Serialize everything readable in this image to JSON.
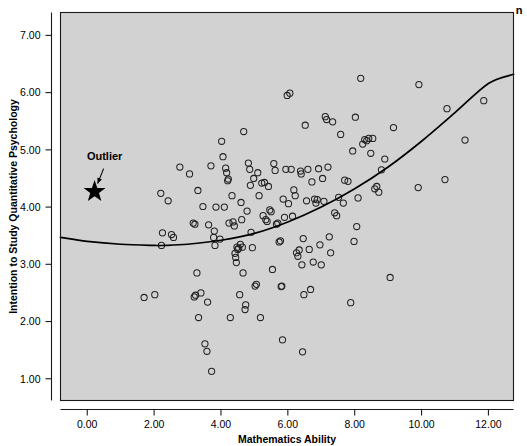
{
  "figure": {
    "corner_mark": "n",
    "background_color": "#ffffff",
    "plot_background_color": "#d2d2d2",
    "point_color": "#222222",
    "curve_color": "#000000",
    "annotation_color": "#000000"
  },
  "annotations": [
    {
      "name": "outlier",
      "label": "Outlier",
      "label_x": 0.52,
      "label_y": 4.83,
      "marker": "star",
      "marker_x": 0.22,
      "marker_y": 4.27
    }
  ],
  "chart_data": {
    "type": "scatter",
    "title": "",
    "subtitle": "",
    "xlabel": "Mathematics Ability",
    "ylabel": "Intention to Study Quantitative Psychology",
    "xlim": [
      -0.8,
      12.75
    ],
    "ylim": [
      0.62,
      7.4
    ],
    "xticks": [
      0,
      2,
      4,
      6,
      8,
      10,
      12
    ],
    "xtick_labels": [
      "0.00",
      "2.00",
      "4.00",
      "6.00",
      "8.00",
      "10.00",
      "12.00"
    ],
    "yticks": [
      1,
      2,
      3,
      4,
      5,
      6,
      7
    ],
    "ytick_labels": [
      "1.00",
      "2.00",
      "3.00",
      "4.00",
      "5.00",
      "6.00",
      "7.00"
    ],
    "grid": false,
    "legend": null,
    "legend_position": "none",
    "series": [
      {
        "name": "Observations",
        "marker": "open-circle",
        "points": [
          [
            1.7,
            2.42
          ],
          [
            2.02,
            2.47
          ],
          [
            2.2,
            4.24
          ],
          [
            2.22,
            3.33
          ],
          [
            2.25,
            3.55
          ],
          [
            2.42,
            4.11
          ],
          [
            2.52,
            3.52
          ],
          [
            2.58,
            3.47
          ],
          [
            2.77,
            4.7
          ],
          [
            3.06,
            4.58
          ],
          [
            3.17,
            3.72
          ],
          [
            3.22,
            3.7
          ],
          [
            3.2,
            2.43
          ],
          [
            3.24,
            2.46
          ],
          [
            3.28,
            2.85
          ],
          [
            3.31,
            4.29
          ],
          [
            3.33,
            2.07
          ],
          [
            3.4,
            2.5
          ],
          [
            3.46,
            4.01
          ],
          [
            3.52,
            1.61
          ],
          [
            3.58,
            1.48
          ],
          [
            3.6,
            2.34
          ],
          [
            3.63,
            3.69
          ],
          [
            3.7,
            4.72
          ],
          [
            3.72,
            1.13
          ],
          [
            3.78,
            3.47
          ],
          [
            3.8,
            3.58
          ],
          [
            3.82,
            3.33
          ],
          [
            3.85,
            4.0
          ],
          [
            3.97,
            3.44
          ],
          [
            4.02,
            5.15
          ],
          [
            4.06,
            4.88
          ],
          [
            4.1,
            4.0
          ],
          [
            4.14,
            4.68
          ],
          [
            4.17,
            4.6
          ],
          [
            4.2,
            4.46
          ],
          [
            4.22,
            4.49
          ],
          [
            4.24,
            3.72
          ],
          [
            4.28,
            2.07
          ],
          [
            4.33,
            4.2
          ],
          [
            4.36,
            3.74
          ],
          [
            4.4,
            3.67
          ],
          [
            4.42,
            3.19
          ],
          [
            4.44,
            3.12
          ],
          [
            4.46,
            3.03
          ],
          [
            4.48,
            3.3
          ],
          [
            4.5,
            3.26
          ],
          [
            4.53,
            3.28
          ],
          [
            4.56,
            2.47
          ],
          [
            4.58,
            3.35
          ],
          [
            4.6,
            4.08
          ],
          [
            4.62,
            3.78
          ],
          [
            4.64,
            3.3
          ],
          [
            4.66,
            2.85
          ],
          [
            4.68,
            5.32
          ],
          [
            4.72,
            2.21
          ],
          [
            4.74,
            2.29
          ],
          [
            4.78,
            3.93
          ],
          [
            4.82,
            4.77
          ],
          [
            4.86,
            4.66
          ],
          [
            4.88,
            4.38
          ],
          [
            4.9,
            3.56
          ],
          [
            4.94,
            3.29
          ],
          [
            4.98,
            4.5
          ],
          [
            5.02,
            2.62
          ],
          [
            5.06,
            2.65
          ],
          [
            5.1,
            4.6
          ],
          [
            5.14,
            4.2
          ],
          [
            5.18,
            2.07
          ],
          [
            5.22,
            4.42
          ],
          [
            5.26,
            3.85
          ],
          [
            5.3,
            4.43
          ],
          [
            5.34,
            3.78
          ],
          [
            5.38,
            3.75
          ],
          [
            5.42,
            4.36
          ],
          [
            5.46,
            3.95
          ],
          [
            5.5,
            3.92
          ],
          [
            5.54,
            2.91
          ],
          [
            5.58,
            4.76
          ],
          [
            5.62,
            4.64
          ],
          [
            5.66,
            3.7
          ],
          [
            5.7,
            3.72
          ],
          [
            5.74,
            3.39
          ],
          [
            5.78,
            3.41
          ],
          [
            5.8,
            2.61
          ],
          [
            5.82,
            2.62
          ],
          [
            5.84,
            1.68
          ],
          [
            5.86,
            4.14
          ],
          [
            5.9,
            3.82
          ],
          [
            5.94,
            4.66
          ],
          [
            5.98,
            5.95
          ],
          [
            6.02,
            4.06
          ],
          [
            6.06,
            5.99
          ],
          [
            6.1,
            4.66
          ],
          [
            6.14,
            3.84
          ],
          [
            6.18,
            4.3
          ],
          [
            6.22,
            4.2
          ],
          [
            6.26,
            3.2
          ],
          [
            6.3,
            3.14
          ],
          [
            6.34,
            3.25
          ],
          [
            6.38,
            4.63
          ],
          [
            6.4,
            4.58
          ],
          [
            6.42,
            2.99
          ],
          [
            6.44,
            1.47
          ],
          [
            6.46,
            3.45
          ],
          [
            6.48,
            2.47
          ],
          [
            6.52,
            5.43
          ],
          [
            6.56,
            4.11
          ],
          [
            6.6,
            4.66
          ],
          [
            6.64,
            3.26
          ],
          [
            6.68,
            2.56
          ],
          [
            6.72,
            4.44
          ],
          [
            6.76,
            3.04
          ],
          [
            6.8,
            4.14
          ],
          [
            6.84,
            4.07
          ],
          [
            6.88,
            4.13
          ],
          [
            6.92,
            4.67
          ],
          [
            6.96,
            3.34
          ],
          [
            7.0,
            2.99
          ],
          [
            7.04,
            4.5
          ],
          [
            7.08,
            4.1
          ],
          [
            7.12,
            5.58
          ],
          [
            7.16,
            5.53
          ],
          [
            7.2,
            4.7
          ],
          [
            7.24,
            3.48
          ],
          [
            7.28,
            3.2
          ],
          [
            7.34,
            5.49
          ],
          [
            7.4,
            3.9
          ],
          [
            7.46,
            3.85
          ],
          [
            7.52,
            4.17
          ],
          [
            7.58,
            5.27
          ],
          [
            7.66,
            4.07
          ],
          [
            7.7,
            4.47
          ],
          [
            7.8,
            4.45
          ],
          [
            7.88,
            2.33
          ],
          [
            7.94,
            4.98
          ],
          [
            7.98,
            3.4
          ],
          [
            8.02,
            5.57
          ],
          [
            8.06,
            3.66
          ],
          [
            8.1,
            4.16
          ],
          [
            8.18,
            6.25
          ],
          [
            8.24,
            5.1
          ],
          [
            8.3,
            5.18
          ],
          [
            8.36,
            5.16
          ],
          [
            8.42,
            5.2
          ],
          [
            8.48,
            4.94
          ],
          [
            8.54,
            5.2
          ],
          [
            8.6,
            4.32
          ],
          [
            8.66,
            4.36
          ],
          [
            8.72,
            4.26
          ],
          [
            8.8,
            4.65
          ],
          [
            8.9,
            4.84
          ],
          [
            9.06,
            2.77
          ],
          [
            9.16,
            5.39
          ],
          [
            9.9,
            4.34
          ],
          [
            9.92,
            6.14
          ],
          [
            10.7,
            4.48
          ],
          [
            10.76,
            5.72
          ],
          [
            11.3,
            5.17
          ],
          [
            11.86,
            5.86
          ]
        ]
      }
    ],
    "fit_curve": {
      "name": "Quadratic regression",
      "type": "quadratic",
      "points": [
        [
          -0.8,
          3.47
        ],
        [
          0.0,
          3.4
        ],
        [
          1.0,
          3.35
        ],
        [
          2.0,
          3.33
        ],
        [
          2.3,
          3.33
        ],
        [
          3.0,
          3.35
        ],
        [
          4.0,
          3.42
        ],
        [
          5.0,
          3.54
        ],
        [
          6.0,
          3.74
        ],
        [
          7.0,
          4.0
        ],
        [
          8.0,
          4.32
        ],
        [
          9.0,
          4.7
        ],
        [
          10.0,
          5.15
        ],
        [
          11.0,
          5.65
        ],
        [
          12.0,
          6.16
        ],
        [
          12.75,
          6.32
        ]
      ]
    }
  }
}
